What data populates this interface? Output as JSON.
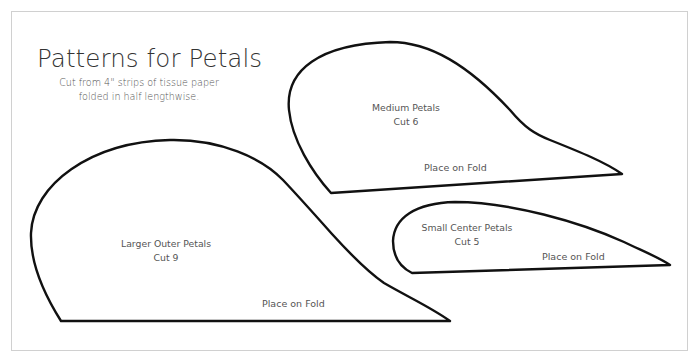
{
  "document": {
    "title": "Patterns for Petals",
    "subtitle_lines": [
      "Cut from 4\" strips of tissue paper",
      "folded in half lengthwise."
    ],
    "patterns": [
      {
        "name": "Larger Outer Petals",
        "cut": "Cut 9",
        "fold_label": "Place on Fold"
      },
      {
        "name": "Medium Petals",
        "cut": "Cut 6",
        "fold_label": "Place on Fold"
      },
      {
        "name": "Small Center Petals",
        "cut": "Cut 5",
        "fold_label": "Place on Fold"
      }
    ],
    "colors": {
      "outline": "#111111",
      "frame": "#d0d0d0",
      "text": "#555555"
    }
  }
}
